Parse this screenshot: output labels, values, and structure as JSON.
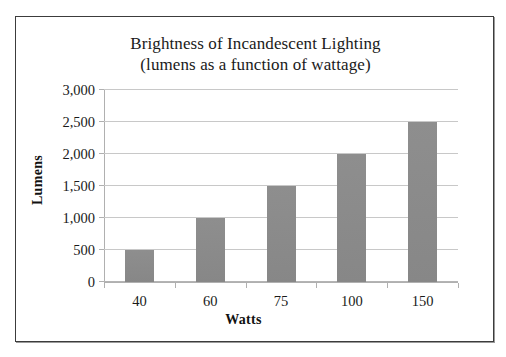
{
  "chart_data": {
    "type": "bar",
    "title": "Brightness of Incandescent Lighting",
    "subtitle": "(lumens as a function of wattage)",
    "xlabel": "Watts",
    "ylabel": "Lumens",
    "categories": [
      "40",
      "60",
      "75",
      "100",
      "150"
    ],
    "values": [
      500,
      1000,
      1500,
      2000,
      2500
    ],
    "ylim": [
      0,
      3000
    ],
    "ytick_values": [
      0,
      500,
      1000,
      1500,
      2000,
      2500,
      3000
    ],
    "ytick_labels": [
      "0",
      "500",
      "1,000",
      "1,500",
      "2,000",
      "2,500",
      "3,000"
    ],
    "grid": true,
    "legend": false,
    "bar_color": "#8c8c8c",
    "gridline_color": "#c8c8c8",
    "axis_color": "#b0b0b0",
    "frame_color": "#3c3c3c",
    "background": "#ffffff",
    "series": [
      {
        "name": "Lumens",
        "values": [
          500,
          1000,
          1500,
          2000,
          2500
        ]
      }
    ]
  }
}
